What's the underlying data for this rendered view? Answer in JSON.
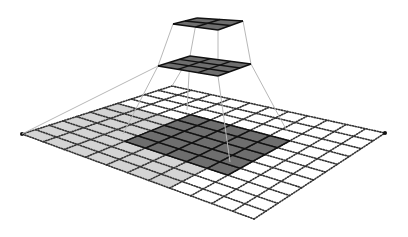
{
  "diagram": {
    "title": "Receptive field of stacked convolution layers",
    "colors": {
      "background": "#ffffff",
      "dark_cell": "#6e6e6e",
      "light_cell": "#d4d4d4",
      "dotted_line": "#333333",
      "solid_line": "#111111",
      "connector": "#b8b8b8",
      "layer_fill": "#808080"
    },
    "layers": [
      {
        "name": "input-layer",
        "corners": {
          "left": [
            22,
            134
          ],
          "top": [
            172,
            86
          ],
          "right": [
            385,
            133
          ],
          "bottom": [
            254,
            219
          ]
        },
        "rows": 11,
        "cols": 11,
        "style": "dotted",
        "regions": [
          {
            "kind": "light",
            "row0": 0,
            "col0": 0,
            "rows": 7,
            "cols": 7
          },
          {
            "kind": "dark",
            "row0": 3,
            "col0": 3,
            "rows": 5,
            "cols": 5
          }
        ]
      },
      {
        "name": "hidden-layer",
        "corners": {
          "left": [
            158,
            66
          ],
          "top": [
            190,
            56
          ],
          "right": [
            251,
            64
          ],
          "bottom": [
            218,
            76
          ]
        },
        "rows": 3,
        "cols": 3,
        "style": "solid",
        "regions": [
          {
            "kind": "dark",
            "row0": 0,
            "col0": 0,
            "rows": 3,
            "cols": 3
          }
        ]
      },
      {
        "name": "output-layer",
        "corners": {
          "left": [
            173,
            24
          ],
          "top": [
            197,
            18
          ],
          "right": [
            243,
            21
          ],
          "bottom": [
            218,
            30
          ]
        },
        "rows": 2,
        "cols": 2,
        "style": "solid",
        "regions": [
          {
            "kind": "dark",
            "row0": 0,
            "col0": 0,
            "rows": 2,
            "cols": 2
          }
        ]
      }
    ],
    "connectors": [
      {
        "from": [
          173,
          24
        ],
        "to": [
          158,
          66
        ]
      },
      {
        "from": [
          197,
          18
        ],
        "to": [
          190,
          56
        ]
      },
      {
        "from": [
          243,
          21
        ],
        "to": [
          251,
          64
        ]
      },
      {
        "from": [
          218,
          30
        ],
        "to": [
          218,
          76
        ]
      },
      {
        "from": [
          158,
          66
        ],
        "to": [
          123,
          134
        ]
      },
      {
        "from": [
          190,
          56
        ],
        "to": [
          187,
          110
        ]
      },
      {
        "from": [
          251,
          64
        ],
        "to": [
          287,
          131
        ]
      },
      {
        "from": [
          218,
          76
        ],
        "to": [
          230,
          162
        ]
      },
      {
        "from": [
          158,
          66
        ],
        "to": [
          22,
          134
        ]
      },
      {
        "from": [
          190,
          56
        ],
        "to": [
          172,
          86
        ]
      }
    ]
  }
}
